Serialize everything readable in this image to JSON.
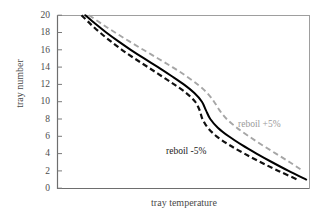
{
  "chart_data": {
    "type": "line",
    "title": "",
    "subtitle": "",
    "xlabel": "tray temperature",
    "ylabel": "tray number",
    "grid": false,
    "legend_position": "inline-annotations",
    "ylim": [
      0,
      20
    ],
    "ytick_labels": [
      "0",
      "2",
      "4",
      "6",
      "8",
      "10",
      "12",
      "14",
      "16",
      "18",
      "20"
    ],
    "ytick_values": [
      0,
      2,
      4,
      6,
      8,
      10,
      12,
      14,
      16,
      18,
      20
    ],
    "xlim": [
      0,
      100
    ],
    "xtick_labels": [],
    "xtick_values": [],
    "annotations": [
      {
        "text": "reboil -5%",
        "color": "#1a1a1a",
        "x": 52,
        "y": 4.5
      },
      {
        "text": "reboil +5%",
        "color": "#9a9a9a",
        "x": 78,
        "y": 6.6
      }
    ],
    "series": [
      {
        "name": "reboil -5%",
        "style": "dashed",
        "color": "#111111",
        "y": [
          20,
          19,
          18,
          17,
          16,
          15,
          14,
          13,
          12,
          11,
          10,
          9,
          8,
          7,
          6,
          5,
          4,
          3,
          2,
          1
        ],
        "x": [
          9.5,
          13.0,
          16.8,
          21.0,
          25.5,
          30.5,
          35.8,
          41.0,
          46.2,
          51.0,
          54.5,
          56.3,
          57.4,
          59.5,
          63.0,
          68.0,
          74.0,
          80.5,
          87.5,
          95.0
        ]
      },
      {
        "name": "base",
        "style": "solid",
        "color": "#000000",
        "y": [
          20,
          19,
          18,
          17,
          16,
          15,
          14,
          13,
          12,
          11,
          10,
          9,
          8,
          7,
          6,
          5,
          4,
          3,
          2,
          1
        ],
        "x": [
          11.0,
          15.0,
          19.3,
          24.0,
          29.0,
          34.3,
          39.8,
          45.0,
          50.0,
          54.2,
          57.2,
          58.8,
          60.5,
          63.5,
          67.8,
          73.0,
          78.8,
          85.0,
          91.5,
          98.5
        ]
      },
      {
        "name": "reboil +5%",
        "style": "dashed",
        "color": "#a6a6a6",
        "y": [
          20,
          19,
          18,
          17,
          16,
          15,
          14,
          13,
          12,
          11,
          10,
          9,
          8,
          7,
          6,
          5,
          4,
          3,
          2,
          1
        ],
        "x": [
          12.5,
          17.5,
          22.8,
          28.3,
          34.0,
          39.8,
          45.5,
          50.8,
          55.5,
          59.3,
          62.0,
          64.2,
          67.0,
          71.0,
          75.8,
          81.0,
          86.5,
          92.0,
          97.2,
          101.5
        ]
      }
    ]
  },
  "axes": {
    "y_tick_labels": {
      "t20": "20",
      "t18": "18",
      "t16": "16",
      "t14": "14",
      "t12": "12",
      "t10": "10",
      "t8": "8",
      "t6": "6",
      "t4": "4",
      "t2": "2",
      "t0": "0"
    },
    "y_axis_title": "tray number",
    "x_axis_title": "tray temperature"
  },
  "labels": {
    "reboil_minus": "reboil -5%",
    "reboil_plus": "reboil +5%"
  },
  "colors": {
    "axis": "#808080",
    "base_curve": "#000000",
    "minus_curve": "#111111",
    "plus_curve": "#a6a6a6",
    "text": "#4a4a4a"
  }
}
